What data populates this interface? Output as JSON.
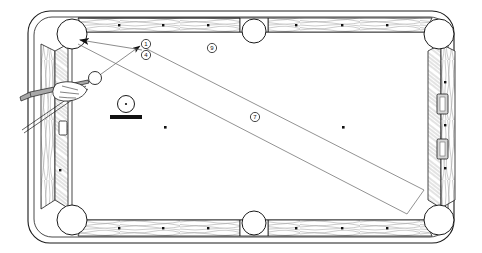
{
  "table": {
    "frame_color": "#ffffff",
    "outline_color": "#1a1a1a",
    "cloth_color": "#ffffff",
    "rail_texture": "wood-grain",
    "rail_label": "cushion-rail",
    "pockets": [
      {
        "name": "pocket-top-left",
        "cx": 72,
        "cy": 34,
        "r": 15
      },
      {
        "name": "pocket-top-middle",
        "cx": 254,
        "cy": 31,
        "r": 12
      },
      {
        "name": "pocket-top-right",
        "cx": 439,
        "cy": 34,
        "r": 15
      },
      {
        "name": "pocket-bottom-left",
        "cx": 72,
        "cy": 220,
        "r": 15
      },
      {
        "name": "pocket-bottom-middle",
        "cx": 254,
        "cy": 223,
        "r": 12
      },
      {
        "name": "pocket-bottom-right",
        "cx": 439,
        "cy": 220,
        "r": 15
      }
    ],
    "diamonds_top": [
      120,
      164,
      209,
      297,
      343,
      388
    ],
    "diamonds_bottom": [
      120,
      164,
      209,
      297,
      343,
      388
    ],
    "diamonds_left": [
      85,
      170
    ],
    "diamonds_right": [
      82,
      125,
      168
    ],
    "sight_plates_right": [
      {
        "name": "sight-plate-upper",
        "y": 103
      },
      {
        "name": "sight-plate-lower",
        "y": 148
      }
    ],
    "sight_plate_left": {
      "name": "sight-plate-left",
      "y": 128
    }
  },
  "balls": [
    {
      "name": "cue-ball",
      "label": "",
      "cx": 95,
      "cy": 78,
      "r": 6.5,
      "style": "outline"
    },
    {
      "name": "object-ball",
      "label": "",
      "cx": 126,
      "cy": 104,
      "r": 8.5,
      "style": "outline-with-base"
    }
  ],
  "base_bar": {
    "name": "object-ball-base-bar",
    "x": 110,
    "y": 115,
    "w": 32,
    "h": 4,
    "color": "#111111"
  },
  "markers": [
    {
      "name": "callout-1",
      "text": "1",
      "cx": 146,
      "cy": 44,
      "r": 4.6
    },
    {
      "name": "callout-4",
      "text": "4",
      "cx": 146,
      "cy": 55,
      "r": 4.6
    },
    {
      "name": "callout-9",
      "text": "9",
      "cx": 212,
      "cy": 48,
      "r": 4.6
    },
    {
      "name": "callout-7",
      "text": "7",
      "cx": 255,
      "cy": 117,
      "r": 4.6
    }
  ],
  "trajectory": {
    "aim_arrow": {
      "name": "aim-arrow",
      "from": [
        95,
        78
      ],
      "to": [
        140,
        44
      ]
    },
    "pocket_arrow": {
      "name": "pocket-arrow",
      "from": [
        140,
        52
      ],
      "to": [
        72,
        40
      ]
    },
    "wedge_upper": {
      "name": "wedge-upper-line",
      "from": [
        143,
        47
      ],
      "to": [
        424,
        190
      ]
    },
    "wedge_lower": {
      "name": "wedge-lower-line",
      "from": [
        76,
        42
      ],
      "to": [
        407,
        214
      ]
    },
    "wedge_close": {
      "name": "wedge-closing-line",
      "from": [
        424,
        190
      ],
      "to": [
        407,
        214
      ]
    }
  },
  "cue": {
    "name": "cue-stick",
    "butt": [
      26,
      98
    ],
    "tip": [
      88,
      82
    ],
    "hand_label": "bridge-hand",
    "shaft_color": "#9a9a9a"
  },
  "colors": {
    "ink": "#1a1a1a",
    "rail_light": "#f2f2f2",
    "rail_shade": "#c8c8c8",
    "marker_fill": "#ffffff",
    "dark": "#111111"
  }
}
